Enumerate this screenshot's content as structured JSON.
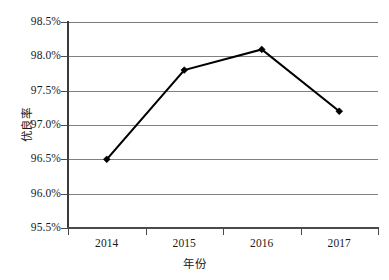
{
  "chart_data": {
    "type": "line",
    "title": "",
    "categories": [
      "2014",
      "2015",
      "2016",
      "2017"
    ],
    "values": [
      96.5,
      97.8,
      98.1,
      97.2
    ],
    "value_labels": [
      "96.5%",
      "97.8%",
      "98.1%",
      "97.2%"
    ],
    "xlabel": "年份",
    "ylabel": "优良率",
    "ylim": [
      95.5,
      98.5
    ],
    "ytick_values": [
      95.5,
      96.0,
      96.5,
      97.0,
      97.5,
      98.0,
      98.5
    ],
    "ytick_labels": [
      "95.5%",
      "96.0%",
      "96.5%",
      "97.0%",
      "97.5%",
      "98.0%",
      "98.5%"
    ],
    "grid": true,
    "legend": false,
    "series": [
      {
        "name": "优良率",
        "values": [
          96.5,
          97.8,
          98.1,
          97.2
        ],
        "color": "#000000",
        "marker": "diamond"
      }
    ]
  },
  "colors": {
    "line": "#000000",
    "marker": "#000000",
    "gridline": "#808080",
    "spine": "#4a4a4a",
    "text": "#1a1a1a",
    "background": "#ffffff"
  }
}
